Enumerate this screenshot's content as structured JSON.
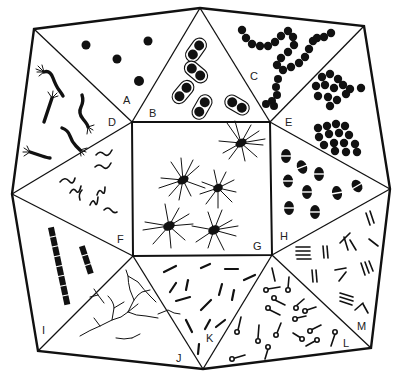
{
  "figure": {
    "ink_color": "#111111",
    "background": "#ffffff"
  },
  "panels": [
    {
      "label": "A",
      "content": "cocci (scattered single spheres)"
    },
    {
      "label": "B",
      "content": "diplococci with capsules"
    },
    {
      "label": "C",
      "content": "streptococci (chains)"
    },
    {
      "label": "D",
      "content": "spirilla with polar flagella tufts"
    },
    {
      "label": "E",
      "content": "staphylococci (grape-like clusters)"
    },
    {
      "label": "F",
      "content": "spirochete-like wavy forms"
    },
    {
      "label": "G",
      "content": "peritrichous flagellated cells"
    },
    {
      "label": "H",
      "content": "bipolar-staining rods"
    },
    {
      "label": "I",
      "content": "segmented chains of rods"
    },
    {
      "label": "J",
      "content": "branching filaments"
    },
    {
      "label": "K",
      "content": "scattered short rods"
    },
    {
      "label": "L",
      "content": "rods with terminal spores"
    },
    {
      "label": "M",
      "content": "palisade / parallel rods"
    }
  ],
  "geometry": {
    "outer": [
      [
        34,
        29
      ],
      [
        200,
        8
      ],
      [
        364,
        26
      ],
      [
        390,
        189
      ],
      [
        371,
        348
      ],
      [
        203,
        369
      ],
      [
        38,
        351
      ],
      [
        12,
        194
      ]
    ],
    "inner_square": [
      [
        132,
        122
      ],
      [
        270,
        122
      ],
      [
        272,
        255
      ],
      [
        133,
        256
      ]
    ]
  }
}
